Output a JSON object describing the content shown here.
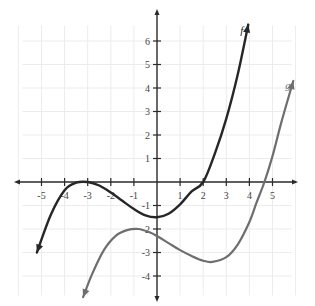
{
  "chart_data": {
    "type": "line",
    "title": "",
    "xlabel": "",
    "ylabel": "",
    "xlim": [
      -6,
      6
    ],
    "ylim": [
      -5,
      7
    ],
    "grid": true,
    "x_ticks": [
      -5,
      -4,
      -3,
      -2,
      -1,
      1,
      2,
      3,
      4,
      5
    ],
    "y_ticks": [
      -4,
      -3,
      -2,
      -1,
      1,
      2,
      3,
      4,
      5,
      6
    ],
    "series": [
      {
        "name": "f",
        "color": "#262626",
        "points": [
          [
            -5.2,
            -3.0
          ],
          [
            -4.6,
            -1.4
          ],
          [
            -4.0,
            -0.35
          ],
          [
            -3.5,
            -0.03
          ],
          [
            -3.0,
            0.0
          ],
          [
            -2.5,
            -0.15
          ],
          [
            -2.0,
            -0.45
          ],
          [
            -1.5,
            -0.8
          ],
          [
            -1.0,
            -1.15
          ],
          [
            -0.5,
            -1.42
          ],
          [
            0.0,
            -1.5
          ],
          [
            0.5,
            -1.35
          ],
          [
            1.0,
            -0.95
          ],
          [
            1.5,
            -0.4
          ],
          [
            2.0,
            0.0
          ],
          [
            2.5,
            1.2
          ],
          [
            3.0,
            2.7
          ],
          [
            3.5,
            4.6
          ],
          [
            3.95,
            6.7
          ]
        ],
        "label_position": [
          3.6,
          6.3
        ]
      },
      {
        "name": "g",
        "color": "#6e6e6e",
        "points": [
          [
            -3.2,
            -4.9
          ],
          [
            -2.8,
            -3.9
          ],
          [
            -2.3,
            -2.9
          ],
          [
            -1.8,
            -2.3
          ],
          [
            -1.3,
            -2.05
          ],
          [
            -0.8,
            -2.0
          ],
          [
            -0.3,
            -2.15
          ],
          [
            0.0,
            -2.3
          ],
          [
            0.5,
            -2.6
          ],
          [
            1.0,
            -2.9
          ],
          [
            1.5,
            -3.15
          ],
          [
            2.0,
            -3.35
          ],
          [
            2.4,
            -3.4
          ],
          [
            3.0,
            -3.2
          ],
          [
            3.5,
            -2.65
          ],
          [
            4.0,
            -1.7
          ],
          [
            4.3,
            -0.9
          ],
          [
            4.65,
            0.0
          ],
          [
            5.0,
            1.1
          ],
          [
            5.4,
            2.6
          ],
          [
            5.9,
            4.3
          ]
        ],
        "label_position": [
          5.55,
          3.95
        ]
      }
    ]
  }
}
